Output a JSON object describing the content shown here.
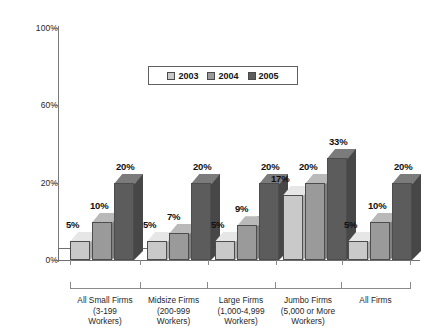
{
  "chart_data": {
    "type": "bar",
    "title": "",
    "subtitle": "",
    "xlabel": "",
    "ylabel": "",
    "ylim": [
      0,
      100
    ],
    "grid": false,
    "legend_position": "top-center",
    "ytick_labels": [
      "0%",
      "20%",
      "60%",
      "100%"
    ],
    "ytick_values": [
      0,
      20,
      60,
      100
    ],
    "categories": [
      "All Small Firms\n(3-199\nWorkers)",
      "Midsize Firms\n(200-999\nWorkers)",
      "Large Firms\n(1,000-4,999\nWorkers)",
      "Jumbo Firms\n(5,000 or More\nWorkers)",
      "All Firms"
    ],
    "series": [
      {
        "name": "2003",
        "color": "#c9c9c9",
        "values": [
          5,
          5,
          5,
          17,
          5
        ],
        "labels": [
          "5%",
          "5%",
          "5%",
          "17%",
          "5%"
        ]
      },
      {
        "name": "2004",
        "color": "#9a9a9a",
        "values": [
          10,
          7,
          9,
          20,
          10
        ],
        "labels": [
          "10%",
          "7%",
          "9%",
          "20%",
          "10%"
        ]
      },
      {
        "name": "2005",
        "color": "#5c5c5c",
        "values": [
          20,
          20,
          20,
          33,
          20
        ],
        "labels": [
          "20%",
          "20%",
          "20%",
          "33%",
          "20%"
        ]
      }
    ]
  },
  "legend": {
    "items": [
      {
        "label": "2003",
        "color": "#c9c9c9"
      },
      {
        "label": "2004",
        "color": "#9a9a9a"
      },
      {
        "label": "2005",
        "color": "#5c5c5c"
      }
    ]
  },
  "axis": {
    "y_labels": [
      "100%",
      "60%",
      "20%",
      "0%"
    ]
  },
  "colors": {
    "series_2003_front": "#c9c9c9",
    "series_2003_top": "#e2e2e2",
    "series_2003_side": "#a8a8a8",
    "series_2004_front": "#9a9a9a",
    "series_2004_top": "#b8b8b8",
    "series_2004_side": "#7d7d7d",
    "series_2005_front": "#5c5c5c",
    "series_2005_top": "#787878",
    "series_2005_side": "#484848",
    "axis": "#7a7a7a",
    "text": "#1a1a1a"
  }
}
